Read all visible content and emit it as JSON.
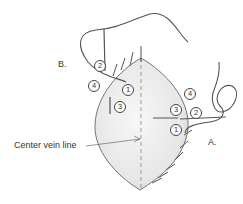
{
  "figure": {
    "labels": {
      "b": "B.",
      "a": "A.",
      "center_vein": "Center vein line"
    },
    "steps_b": {
      "s1": "1",
      "s2": "2",
      "s3": "3",
      "s4": "4"
    },
    "steps_a": {
      "s1": "1",
      "s2": "2",
      "s3": "3",
      "s4": "4"
    },
    "colors": {
      "outline": "#555555",
      "fill_light": "#f2f2f2",
      "fill_shade": "#d8d8d8",
      "thread": "#666666"
    }
  }
}
